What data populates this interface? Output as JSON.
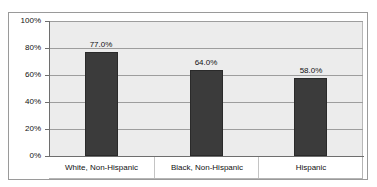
{
  "chart_data": {
    "type": "bar",
    "title": "",
    "subtitle": "",
    "xlabel": "",
    "ylabel": "",
    "ylim": [
      0,
      100
    ],
    "grid": true,
    "legend": false,
    "legend_position": "none",
    "categories": [
      "White, Non-Hispanic",
      "Black, Non-Hispanic",
      "Hispanic"
    ],
    "values": [
      77.0,
      64.0,
      58.0
    ],
    "data_labels": [
      "77.0%",
      "64.0%",
      "58.0%"
    ],
    "y_ticks": [
      0,
      20,
      40,
      60,
      80,
      100
    ],
    "y_tick_labels": [
      "0%",
      "20%",
      "40%",
      "60%",
      "80%",
      "100%"
    ],
    "colors": {
      "bar": "#3b3b3b",
      "bar_border": "#2a2a2a",
      "plot_background": "#ececec",
      "gridline": "#9d9d9d",
      "axis": "#6e6e6e",
      "frame_border": "#9a9a9a",
      "text": "#111111",
      "page_background": "#ffffff"
    }
  }
}
